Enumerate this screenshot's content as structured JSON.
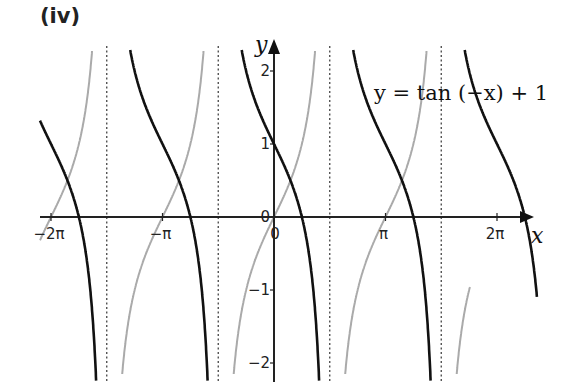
{
  "panel": {
    "label": "(iv)"
  },
  "chart_data": {
    "type": "line",
    "title": "(iv)",
    "xlabel": "x",
    "ylabel": "y",
    "xlim": [
      -6.9,
      7.2
    ],
    "ylim": [
      -2.3,
      2.35
    ],
    "grid": false,
    "x_ticks": [
      {
        "value": -6.2832,
        "label": "−2π"
      },
      {
        "value": -3.1416,
        "label": "−π"
      },
      {
        "value": 0,
        "label": "0"
      },
      {
        "value": 3.1416,
        "label": "π"
      },
      {
        "value": 6.2832,
        "label": "2π"
      }
    ],
    "y_ticks": [
      {
        "value": 2,
        "label": "2"
      },
      {
        "value": 1,
        "label": "1"
      },
      {
        "value": 0,
        "label": "0"
      },
      {
        "value": -1,
        "label": "−1"
      },
      {
        "value": -2,
        "label": "−2"
      }
    ],
    "asymptotes_x": [
      -4.7124,
      -1.5708,
      1.5708,
      4.7124
    ],
    "series": [
      {
        "name": "y = tan(−x) + 1",
        "function": "tan(-x)+1",
        "color": "#111111",
        "style": "solid-thick"
      },
      {
        "name": "y = tan(x)",
        "function": "tan(x)",
        "color": "#aaaaaa",
        "style": "solid-thin"
      }
    ],
    "annotations": [
      {
        "text": "y = tan (−x) + 1",
        "x": 3.3,
        "y": 1.95
      }
    ],
    "sample_points": {
      "tan(-x)+1": [
        {
          "x": -6.28,
          "y": 1.0
        },
        {
          "x": -5.5,
          "y": 0.0
        },
        {
          "x": -3.14,
          "y": 1.0
        },
        {
          "x": -2.36,
          "y": 0.0
        },
        {
          "x": 0,
          "y": 1.0
        },
        {
          "x": 0.785,
          "y": 0.0
        },
        {
          "x": 3.14,
          "y": 1.0
        },
        {
          "x": 3.93,
          "y": 0.0
        },
        {
          "x": 6.28,
          "y": 1.0
        },
        {
          "x": 7.07,
          "y": 0.0
        }
      ],
      "tan(x)": [
        {
          "x": -6.28,
          "y": 0.0
        },
        {
          "x": -3.14,
          "y": 0.0
        },
        {
          "x": 0,
          "y": 0.0
        },
        {
          "x": 3.14,
          "y": 0.0
        },
        {
          "x": 6.28,
          "y": 0.0
        }
      ]
    }
  },
  "colors": {
    "axis": "#222222",
    "main_curve": "#111111",
    "reference_curve": "#aaaaaa",
    "asymptote": "#444444"
  }
}
